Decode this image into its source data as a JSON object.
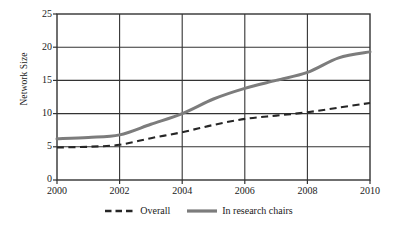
{
  "chart_data": {
    "type": "line",
    "title": "",
    "xlabel": "",
    "ylabel": "Network Size",
    "xlim": [
      2000,
      2010
    ],
    "ylim": [
      0,
      25
    ],
    "x": [
      2000,
      2001,
      2002,
      2003,
      2004,
      2005,
      2006,
      2007,
      2008,
      2009,
      2010
    ],
    "xticks": [
      2000,
      2002,
      2004,
      2006,
      2008,
      2010
    ],
    "xtick_labels": [
      "2000",
      "2002",
      "2004",
      "2006",
      "2008",
      "2010"
    ],
    "yticks": [
      0,
      5,
      10,
      15,
      20,
      25
    ],
    "ytick_labels": [
      "0",
      "5",
      "10",
      "15",
      "20",
      "25"
    ],
    "grid": "both",
    "legend_position": "bottom-center",
    "series": [
      {
        "name": "Overall",
        "style": "dashed",
        "color": "#262626",
        "width": 2.1,
        "values": [
          4.9,
          5.0,
          5.3,
          6.3,
          7.2,
          8.3,
          9.2,
          9.7,
          10.2,
          10.9,
          11.6
        ]
      },
      {
        "name": "In research chairs",
        "style": "solid",
        "color": "#7c7c7c",
        "width": 3.0,
        "values": [
          6.2,
          6.4,
          6.8,
          8.4,
          10.0,
          12.2,
          13.8,
          15.0,
          16.2,
          18.4,
          19.3
        ]
      }
    ]
  },
  "axes": {
    "y_title": "Network Size",
    "y_tick_labels": [
      "0",
      "5",
      "10",
      "15",
      "20",
      "25"
    ],
    "x_tick_labels": [
      "2000",
      "2002",
      "2004",
      "2006",
      "2008",
      "2010"
    ]
  },
  "legend": {
    "items": [
      {
        "label": "Overall",
        "swatch": "dashed-line-swatch"
      },
      {
        "label": "In research chairs",
        "swatch": "solid-line-swatch"
      }
    ]
  },
  "colors": {
    "axis": "#333333",
    "grid": "#333333",
    "series_overall": "#262626",
    "series_chairs": "#7c7c7c",
    "background": "#ffffff"
  }
}
